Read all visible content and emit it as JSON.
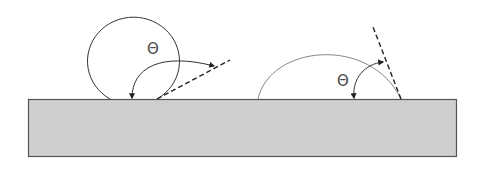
{
  "diagram": {
    "labels": {
      "left_angle": "Θ",
      "right_angle": "Θ"
    },
    "colors": {
      "substrate_fill": "#cfcfcf",
      "substrate_stroke": "#555555",
      "drop_stroke": "#333333",
      "drop_stroke_light": "#888888",
      "line": "#222222"
    },
    "elements": [
      {
        "name": "substrate",
        "type": "rectangle"
      },
      {
        "name": "left-drop",
        "type": "near-spherical droplet (high contact angle)"
      },
      {
        "name": "right-drop",
        "type": "spreading droplet (low contact angle)"
      },
      {
        "name": "left-tangent",
        "type": "dashed tangent line"
      },
      {
        "name": "right-tangent",
        "type": "dashed tangent line"
      },
      {
        "name": "left-angle-arc",
        "type": "double-headed arrow arc"
      },
      {
        "name": "right-angle-arc",
        "type": "double-headed arrow arc"
      }
    ]
  }
}
